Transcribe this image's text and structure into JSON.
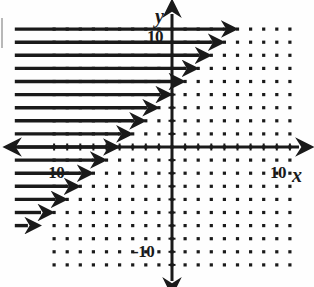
{
  "figure": {
    "title": "",
    "kind": "coordinate-grid-with-rays",
    "axis_labels": {
      "x": "x",
      "y": "y"
    },
    "tick_labels": {
      "x_positive": "10",
      "x_negative": "-10",
      "y_positive": "10",
      "y_negative": "-10"
    },
    "ink_color": "#1a1a1a",
    "background_color": "#fefefe"
  },
  "chart_data": {
    "type": "scatter",
    "title": "",
    "xlabel": "x",
    "ylabel": "y",
    "xlim": [
      -13,
      13
    ],
    "ylim": [
      -13,
      13
    ],
    "grid": true,
    "grid_style": "dot-lattice",
    "grid_step": 1,
    "axis_ticks": {
      "x": [
        -10,
        10
      ],
      "y": [
        -10,
        10
      ]
    },
    "annotations": [
      "Horizontal rays drawn to the right; their left endpoints lie on the left edge of the dot grid and their right endpoints trace a line of slope 1 through about (0, 5).",
      "Shaded/hatched half-plane to the upper-left of the boundary line."
    ],
    "boundary_line": {
      "slope": 1,
      "intercept": 5,
      "style": "implied-by-ray-endpoints"
    },
    "rays": [
      {
        "y": 9,
        "x_start": -12,
        "x_end": 4,
        "arrow": "right"
      },
      {
        "y": 8,
        "x_start": -12,
        "x_end": 3,
        "arrow": "right"
      },
      {
        "y": 7,
        "x_start": -12,
        "x_end": 2,
        "arrow": "right"
      },
      {
        "y": 6,
        "x_start": -12,
        "x_end": 1,
        "arrow": "right"
      },
      {
        "y": 5,
        "x_start": -12,
        "x_end": 0,
        "arrow": "right"
      },
      {
        "y": 4,
        "x_start": -12,
        "x_end": -1,
        "arrow": "right"
      },
      {
        "y": 3,
        "x_start": -12,
        "x_end": -2,
        "arrow": "right"
      },
      {
        "y": 2,
        "x_start": -12,
        "x_end": -3,
        "arrow": "right"
      },
      {
        "y": 1,
        "x_start": -12,
        "x_end": -4,
        "arrow": "right"
      },
      {
        "y": 0,
        "x_start": -12,
        "x_end": -5,
        "arrow": "right"
      },
      {
        "y": -1,
        "x_start": -12,
        "x_end": -6,
        "arrow": "right"
      },
      {
        "y": -2,
        "x_start": -12,
        "x_end": -7,
        "arrow": "right"
      },
      {
        "y": -3,
        "x_start": -12,
        "x_end": -8,
        "arrow": "right"
      },
      {
        "y": -4,
        "x_start": -12,
        "x_end": -9,
        "arrow": "right"
      },
      {
        "y": -5,
        "x_start": -12,
        "x_end": -10,
        "arrow": "right"
      },
      {
        "y": -6,
        "x_start": -12,
        "x_end": -11,
        "arrow": "right"
      }
    ]
  }
}
